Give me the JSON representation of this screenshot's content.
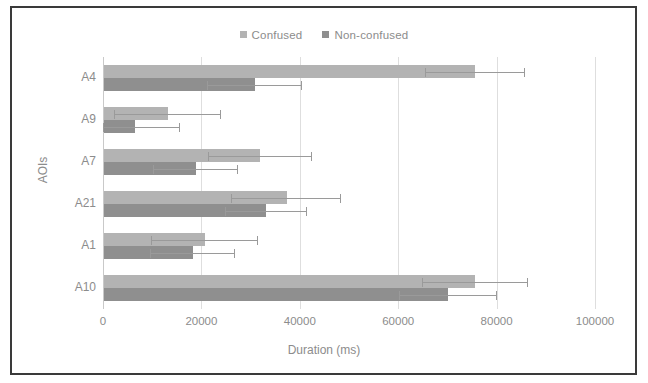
{
  "chart_data": {
    "type": "bar",
    "orientation": "horizontal",
    "title": "",
    "xlabel": "Duration (ms)",
    "ylabel": "AOIs",
    "xlim": [
      0,
      100000
    ],
    "xticks": [
      0,
      20000,
      40000,
      60000,
      80000,
      100000
    ],
    "xticklabels": [
      "0",
      "20000",
      "40000",
      "60000",
      "80000",
      "100000"
    ],
    "categories": [
      "A4",
      "A9",
      "A7",
      "A21",
      "A1",
      "A10"
    ],
    "grid": true,
    "grid_axis": "x",
    "legend_position": "top-center",
    "series": [
      {
        "name": "Confused",
        "color": "#b3b3b3",
        "values": [
          75500,
          13000,
          31800,
          37100,
          20500,
          75500
        ],
        "errors_upper": [
          10000,
          10800,
          10500,
          11000,
          10800,
          10700
        ]
      },
      {
        "name": "Non-confused",
        "color": "#8f8f8f",
        "values": [
          30700,
          6200,
          18700,
          33000,
          18100,
          70000
        ],
        "errors_upper": [
          9500,
          9300,
          8600,
          8200,
          8500,
          9900
        ]
      }
    ]
  },
  "legend": {
    "items": [
      {
        "label": "Confused",
        "color": "#b3b3b3"
      },
      {
        "label": "Non-confused",
        "color": "#8f8f8f"
      }
    ]
  },
  "axes": {
    "x_title": "Duration (ms)",
    "y_title": "AOIs"
  }
}
